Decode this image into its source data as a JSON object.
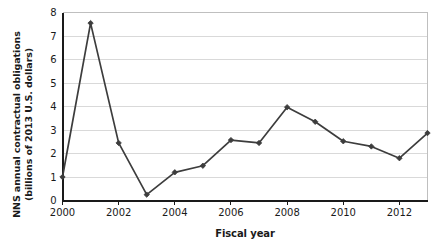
{
  "chart_data": {
    "type": "line",
    "title": "",
    "xlabel": "Fiscal year",
    "ylabel": "NNS annual contractual obligations (billions of 2013 U.S. dollars)",
    "ylabel_lines": [
      "NNS annual contractual obligations",
      "(billions of 2013 U.S. dollars)"
    ],
    "x": [
      2000,
      2001,
      2002,
      2003,
      2004,
      2005,
      2006,
      2007,
      2008,
      2009,
      2010,
      2011,
      2012,
      2013
    ],
    "values": [
      1.0,
      7.55,
      2.45,
      0.25,
      1.2,
      1.48,
      2.57,
      2.45,
      3.97,
      3.35,
      2.52,
      2.3,
      1.8,
      2.87
    ],
    "categories": [
      "2000",
      "2001",
      "2002",
      "2003",
      "2004",
      "2005",
      "2006",
      "2007",
      "2008",
      "2009",
      "2010",
      "2011",
      "2012",
      "2013"
    ],
    "xlim": [
      2000,
      2013
    ],
    "ylim": [
      0,
      8
    ],
    "ytick_labels": [
      "0",
      "1",
      "2",
      "3",
      "4",
      "5",
      "6",
      "7",
      "8"
    ],
    "ytick_values": [
      0,
      1,
      2,
      3,
      4,
      5,
      6,
      7,
      8
    ],
    "xtick_labels": [
      "2000",
      "2002",
      "2004",
      "2006",
      "2008",
      "2010",
      "2012"
    ],
    "xtick_values": [
      2000,
      2002,
      2004,
      2006,
      2008,
      2010,
      2012
    ],
    "grid": "horizontal",
    "legend": "none",
    "series_color": "#3d3d3d",
    "grid_color": "#d9d9d9",
    "axis_color": "#1a1a1a",
    "marker": "diamond"
  }
}
